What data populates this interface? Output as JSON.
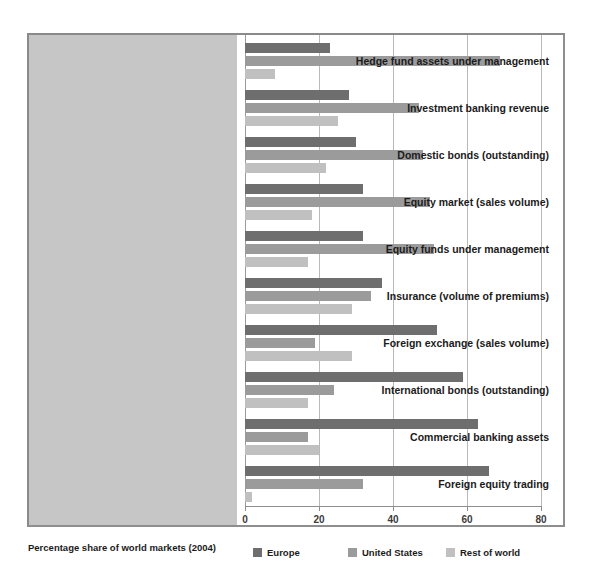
{
  "chart_data": {
    "type": "bar",
    "orientation": "horizontal",
    "title": "",
    "subtitle": "",
    "xlabel": "",
    "ylabel": "",
    "xlim": [
      0,
      80
    ],
    "xticks": [
      0,
      20,
      40,
      60,
      80
    ],
    "xtick_labels": [
      "0",
      "20",
      "40",
      "60",
      "80"
    ],
    "grid": true,
    "legend_position": "bottom",
    "legend_title": "Percentage share of world markets (2004)",
    "categories": [
      "Hedge fund assets under management",
      "Investment banking revenue",
      "Domestic bonds (outstanding)",
      "Equity market (sales volume)",
      "Equity funds under management",
      "Insurance (volume of premiums)",
      "Foreign exchange (sales volume)",
      "International bonds (outstanding)",
      "Commercial banking assets",
      "Foreign equity trading"
    ],
    "series": [
      {
        "name": "Europe",
        "color": "#6e6e6e",
        "values": [
          23,
          28,
          30,
          32,
          32,
          37,
          52,
          59,
          63,
          66
        ]
      },
      {
        "name": "United States",
        "color": "#9b9b9b",
        "values": [
          69,
          47,
          48,
          50,
          51,
          34,
          19,
          24,
          17,
          32
        ]
      },
      {
        "name": "Rest of world",
        "color": "#c0c0c0",
        "values": [
          8,
          25,
          22,
          18,
          17,
          29,
          29,
          17,
          20,
          2
        ]
      }
    ]
  },
  "legend": {
    "title": "Percentage share of world markets (2004)",
    "entries": [
      {
        "label": "Europe",
        "swatch_class": "europe"
      },
      {
        "label": "United States",
        "swatch_class": "united-states"
      },
      {
        "label": "Rest of world",
        "swatch_class": "rest-of-world"
      }
    ]
  },
  "colors": {
    "europe": "#6e6e6e",
    "united_states": "#9b9b9b",
    "rest_of_world": "#c0c0c0",
    "label_panel": "#c6c6c6",
    "frame": "#8e8e8e",
    "grid": "#b9b9b9",
    "text": "#1b1b1b",
    "background": "#ffffff"
  }
}
